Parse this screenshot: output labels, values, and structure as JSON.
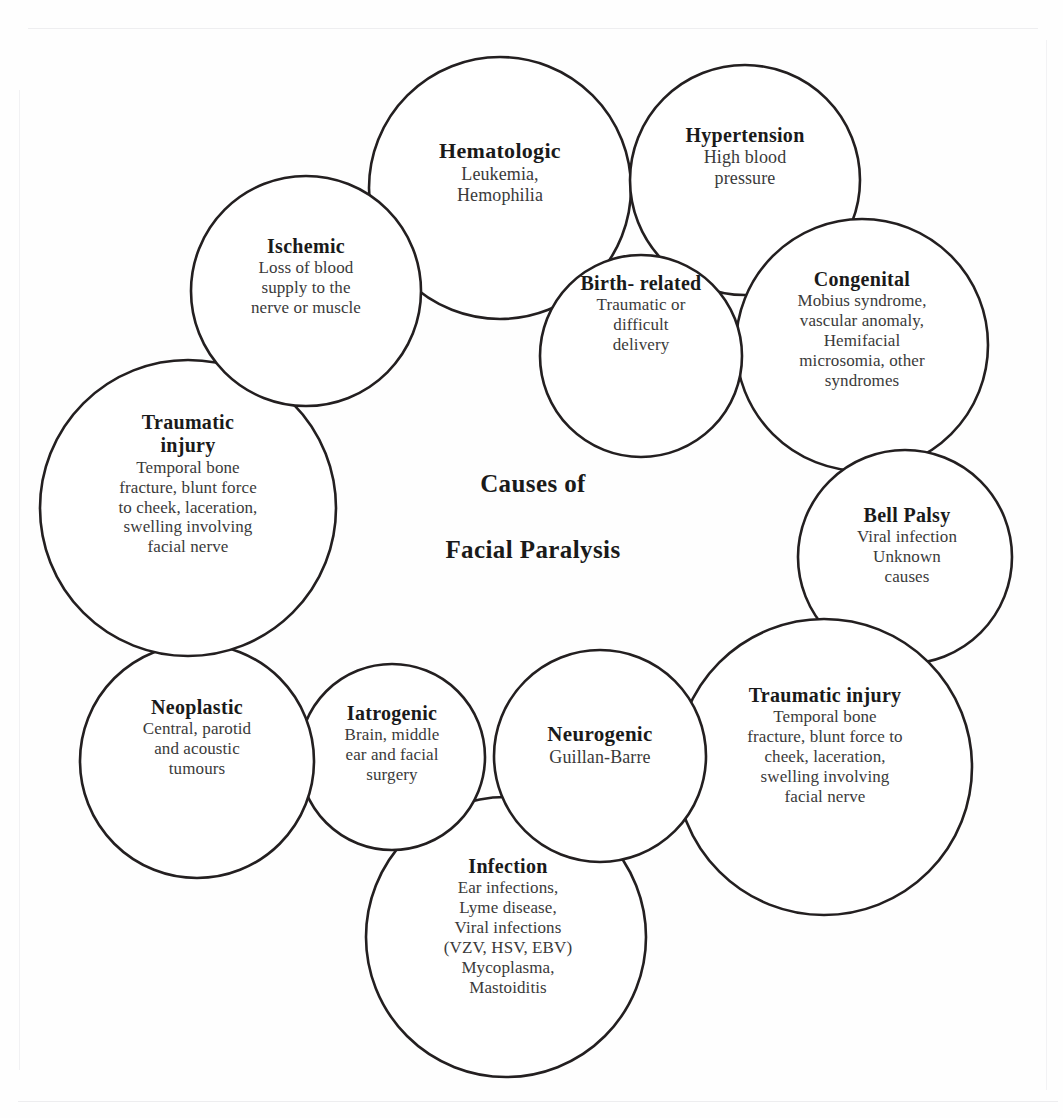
{
  "figure": {
    "center_title_line1": "Causes of",
    "center_title_line2": "Facial Paralysis",
    "stroke_color": "#231f20",
    "background_color": "#ffffff",
    "title_text_color": "#1a1a1a",
    "body_text_color": "#3a3a3a"
  },
  "nodes": [
    {
      "id": "hematologic",
      "title": "Hematologic",
      "lines": [
        "Leukemia,",
        "Hemophilia"
      ]
    },
    {
      "id": "hypertension",
      "title": "Hypertension",
      "lines": [
        "High blood",
        "pressure"
      ]
    },
    {
      "id": "congenital",
      "title": "Congenital",
      "lines": [
        "Mobius syndrome,",
        "vascular anomaly,",
        "Hemifacial",
        "microsomia, other",
        "syndromes"
      ]
    },
    {
      "id": "bell-palsy",
      "title": "Bell  Palsy",
      "lines": [
        "Viral infection",
        "Unknown",
        "causes"
      ]
    },
    {
      "id": "traumatic-injury-right",
      "title": "Traumatic injury",
      "lines": [
        "Temporal bone",
        "fracture, blunt force to",
        "cheek, laceration,",
        "swelling involving",
        "facial nerve"
      ]
    },
    {
      "id": "infection",
      "title": "Infection",
      "lines": [
        "Ear infections,",
        "Lyme disease,",
        "Viral infections",
        "(VZV, HSV, EBV)",
        "Mycoplasma,",
        "Mastoiditis"
      ]
    },
    {
      "id": "neurogenic",
      "title": "Neurogenic",
      "lines": [
        "Guillan-Barre"
      ]
    },
    {
      "id": "iatrogenic",
      "title": "Iatrogenic",
      "lines": [
        "Brain, middle",
        "ear and facial",
        "surgery"
      ]
    },
    {
      "id": "neoplastic",
      "title": "Neoplastic",
      "lines": [
        "Central, parotid",
        "and acoustic",
        "tumours"
      ]
    },
    {
      "id": "traumatic-injury-left",
      "title": "Traumatic injury",
      "lines": [
        "Temporal bone",
        "fracture, blunt force",
        "to cheek, laceration,",
        "swelling involving",
        "facial nerve"
      ]
    },
    {
      "id": "ischemic",
      "title": "Ischemic",
      "lines": [
        "Loss of blood",
        "supply to the",
        "nerve or muscle"
      ]
    },
    {
      "id": "birth-related",
      "title": "Birth-\nrelated",
      "title_lines": [
        "Birth-",
        "related"
      ],
      "lines": [
        "Traumatic or",
        "difficult",
        "delivery"
      ]
    }
  ],
  "circles": [
    {
      "id": "hematologic",
      "cx": 500,
      "cy": 188,
      "r": 131
    },
    {
      "id": "hypertension",
      "cx": 745,
      "cy": 180,
      "r": 115
    },
    {
      "id": "congenital",
      "cx": 862,
      "cy": 345,
      "r": 126
    },
    {
      "id": "bell-palsy",
      "cx": 905,
      "cy": 557,
      "r": 107
    },
    {
      "id": "traumatic-injury-right",
      "cx": 824,
      "cy": 767,
      "r": 148
    },
    {
      "id": "infection",
      "cx": 506,
      "cy": 937,
      "r": 140
    },
    {
      "id": "neurogenic",
      "cx": 600,
      "cy": 756,
      "r": 106
    },
    {
      "id": "iatrogenic",
      "cx": 392,
      "cy": 757,
      "r": 93
    },
    {
      "id": "neoplastic",
      "cx": 197,
      "cy": 761,
      "r": 117
    },
    {
      "id": "traumatic-injury-left",
      "cx": 188,
      "cy": 508,
      "r": 148
    },
    {
      "id": "ischemic",
      "cx": 306,
      "cy": 291,
      "r": 115
    },
    {
      "id": "birth-related",
      "cx": 641,
      "cy": 356,
      "r": 101
    }
  ]
}
